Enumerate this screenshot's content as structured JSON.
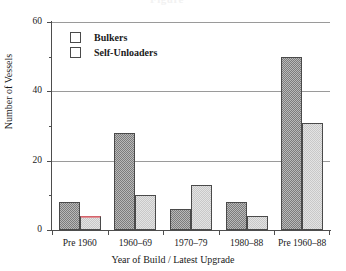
{
  "figure": {
    "ghost_title": "Figure",
    "background": "#ffffff"
  },
  "legend": {
    "position": "inside-top-left",
    "items": [
      {
        "label": "Bulkers",
        "swatch": "dark-hatched-swatch",
        "color": "#8a8a8a"
      },
      {
        "label": "Self-Unloaders",
        "swatch": "light-hatched-swatch",
        "color": "#dcdcdc"
      }
    ]
  },
  "axes": {
    "y": {
      "title": "Number of Vessels",
      "ticks": [
        "0",
        "20",
        "40",
        "60"
      ],
      "minor_ticks": [
        "10",
        "30",
        "50"
      ]
    },
    "x": {
      "title": "Year of Build / Latest Upgrade",
      "categories": [
        "Pre 1960",
        "1960–69",
        "1970–79",
        "1980–88",
        "Pre 1960–88"
      ]
    }
  },
  "chart_data": {
    "type": "bar",
    "title": "",
    "xlabel": "Year of Build / Latest Upgrade",
    "ylabel": "Number of Vessels",
    "categories": [
      "Pre 1960",
      "1960–69",
      "1970–79",
      "1980–88",
      "Pre 1960–88"
    ],
    "series": [
      {
        "name": "Bulkers",
        "values": [
          8,
          28,
          6,
          8,
          50
        ],
        "color": "#8a8a8a"
      },
      {
        "name": "Self-Unloaders",
        "values": [
          4,
          10,
          13,
          4,
          31
        ],
        "color": "#dcdcdc"
      }
    ],
    "ylim": [
      0,
      60
    ],
    "ytick_interval": 20,
    "yminor_tick_interval": 10,
    "grid": "horizontal-major-only",
    "legend_position": "upper left inside plot",
    "annotations": [
      {
        "note": "red top edge on Self-Unloaders bar of category 'Pre 1960'",
        "color": "#d4636b"
      }
    ]
  }
}
